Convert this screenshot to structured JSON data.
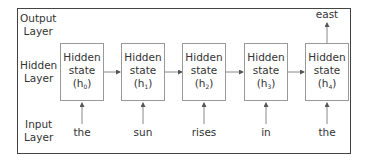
{
  "diagram": {
    "layers": {
      "output": "Output Layer",
      "output_lines": [
        "Output",
        "Layer"
      ],
      "hidden_lines": [
        "Hidden",
        "Layer"
      ],
      "input_lines": [
        "Input",
        "Layer"
      ]
    },
    "hidden_states": [
      {
        "line1": "Hidden",
        "line2": "state",
        "var": "h",
        "index": "0"
      },
      {
        "line1": "Hidden",
        "line2": "state",
        "var": "h",
        "index": "1"
      },
      {
        "line1": "Hidden",
        "line2": "state",
        "var": "h",
        "index": "2"
      },
      {
        "line1": "Hidden",
        "line2": "state",
        "var": "h",
        "index": "3"
      },
      {
        "line1": "Hidden",
        "line2": "state",
        "var": "h",
        "index": "4"
      }
    ],
    "inputs": [
      "the",
      "sun",
      "rises",
      "in",
      "the"
    ],
    "output": "east",
    "colors": {
      "frame": "#444444",
      "box_border": "#999999",
      "arrow": "#555555",
      "text": "#333333"
    }
  }
}
